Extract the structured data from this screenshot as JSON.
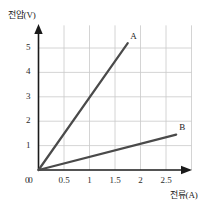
{
  "chart_data": {
    "type": "line",
    "title": "",
    "xlabel": "전류(A)",
    "ylabel": "전압(V)",
    "xlim": [
      0,
      3.0
    ],
    "ylim": [
      0,
      5.6
    ],
    "grid": true,
    "legend_position": "inline-end-of-line",
    "xticks": [
      "0",
      "0.5",
      "1",
      "1.5",
      "2",
      "2.5"
    ],
    "xtick_values": [
      0,
      0.5,
      1,
      1.5,
      2,
      2.5
    ],
    "yticks": [
      "0",
      "1",
      "2",
      "3",
      "4",
      "5"
    ],
    "ytick_values": [
      0,
      1,
      2,
      3,
      4,
      5
    ],
    "series": [
      {
        "name": "A",
        "label": "A",
        "slope": 3.0,
        "color": "#4a4a4a",
        "x": [
          0,
          1.75
        ],
        "y": [
          0,
          5.2
        ],
        "label_x": 1.82,
        "label_y": 5.45
      },
      {
        "name": "B",
        "label": "B",
        "slope": 0.54,
        "color": "#4a4a4a",
        "x": [
          0,
          2.7
        ],
        "y": [
          0,
          1.45
        ],
        "label_x": 2.78,
        "label_y": 1.72
      }
    ],
    "colors": {
      "grid": "#c9c9c9",
      "axis": "#1a1a1a",
      "line": "#4a4a4a",
      "background": "#ffffff",
      "text": "#1a1a1a"
    }
  }
}
